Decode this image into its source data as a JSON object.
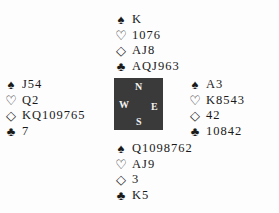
{
  "suits": {
    "spade": "♠",
    "heart": "♡",
    "diamond": "◇",
    "club": "♣"
  },
  "hands": {
    "north": {
      "spades": "K",
      "hearts": "1076",
      "diamonds": "AJ8",
      "clubs": "AQJ963"
    },
    "west": {
      "spades": "J54",
      "hearts": "Q2",
      "diamonds": "KQ109765",
      "clubs": "7"
    },
    "east": {
      "spades": "A3",
      "hearts": "K8543",
      "diamonds": "42",
      "clubs": "10842"
    },
    "south": {
      "spades": "Q1098762",
      "hearts": "AJ9",
      "diamonds": "3",
      "clubs": "K5"
    }
  },
  "compass": {
    "n": "N",
    "s": "S",
    "e": "E",
    "w": "W",
    "color": "#3a3a3a"
  }
}
